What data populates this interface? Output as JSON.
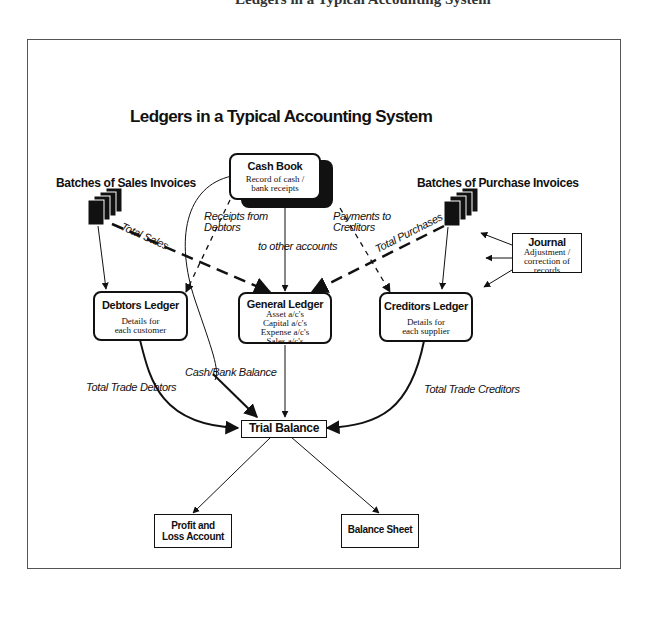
{
  "page": {
    "top_cropped_text": "Ledgers in a Typical Accounting System"
  },
  "diagram": {
    "title": "Ledgers in a Typical Accounting System",
    "nodes": {
      "cash_book": {
        "title": "Cash Book",
        "subtitle": "Record of cash / bank receipts"
      },
      "sales_invoices": {
        "title": "Batches of Sales Invoices"
      },
      "purchase_invoices": {
        "title": "Batches of Purchase Invoices"
      },
      "journal": {
        "title": "Journal",
        "subtitle": "Adjustment / correction of records"
      },
      "debtors_ledger": {
        "title": "Debtors Ledger",
        "subtitle": "Details for each customer"
      },
      "general_ledger": {
        "title": "General Ledger",
        "lines": [
          "Asset a/c's",
          "Capital a/c's",
          "Expense a/c's",
          "Sales a/c's"
        ]
      },
      "creditors_ledger": {
        "title": "Creditors Ledger",
        "subtitle": "Details for each supplier"
      },
      "trial_balance": {
        "title": "Trial Balance"
      },
      "profit_loss": {
        "title": "Profit and Loss Account"
      },
      "balance_sheet": {
        "title": "Balance Sheet"
      }
    },
    "edge_labels": {
      "receipts_from_debtors": "Receipts from Debtors",
      "payments_to_creditors": "Payments to Creditors",
      "to_other_accounts": "to other accounts",
      "total_sales": "Total Sales",
      "total_purchases": "Total Purchases",
      "cash_bank_balance": "Cash/Bank Balance",
      "total_trade_debtors": "Total Trade Debtors",
      "total_trade_creditors": "Total Trade Creditors"
    },
    "colors": {
      "ink": "#111111",
      "background": "#ffffff",
      "frame": "#555555"
    }
  }
}
